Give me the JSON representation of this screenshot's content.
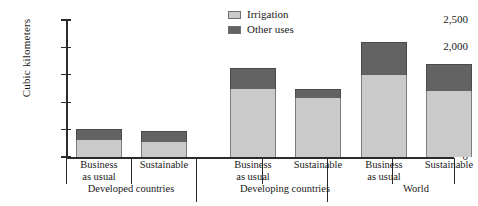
{
  "chart_data": {
    "type": "bar",
    "subtype": "stacked-bar",
    "title": "",
    "xlabel": "",
    "ylabel": "Cubic kilometers",
    "ylim": [
      0,
      2500
    ],
    "yticks": [
      "0",
      "500",
      "1,000",
      "1,500",
      "2,000",
      "2,500"
    ],
    "ytick_values": [
      0,
      500,
      1000,
      1500,
      2000,
      2500
    ],
    "grid": false,
    "legend_position": "top-center",
    "categories": [
      "Business as usual",
      "Sustainable",
      "Business as usual",
      "Sustainable",
      "Business as usual",
      "Sustainable"
    ],
    "groups": [
      {
        "label": "Developed countries",
        "categories": [
          "Business as usual",
          "Sustainable"
        ]
      },
      {
        "label": "Developing countries",
        "categories": [
          "Business as usual",
          "Sustainable"
        ]
      },
      {
        "label": "World",
        "categories": [
          "Business as usual",
          "Sustainable"
        ]
      }
    ],
    "series": [
      {
        "name": "Irrigation",
        "color": "#cacaca",
        "values": [
          310,
          270,
          1250,
          1075,
          1500,
          1200
        ]
      },
      {
        "name": "Other uses",
        "color": "#636363",
        "values": [
          210,
          200,
          375,
          175,
          600,
          500
        ]
      }
    ],
    "totals": [
      520,
      470,
      1625,
      1250,
      2100,
      1700
    ]
  },
  "legend": {
    "items": [
      {
        "label": "Irrigation",
        "color": "#cacaca"
      },
      {
        "label": "Other uses",
        "color": "#636363"
      }
    ]
  },
  "axis": {
    "y_title": "Cubic kilometers"
  }
}
